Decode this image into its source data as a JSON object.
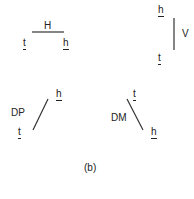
{
  "figure": {
    "caption": "(b)",
    "panels": {
      "horizontal": {
        "label": "H",
        "left_end": "t",
        "right_end": "h"
      },
      "vertical": {
        "label": "V",
        "top_end": "h",
        "bottom_end": "t"
      },
      "diagonal_plus": {
        "label": "DP",
        "top_end": "h",
        "bottom_end": "t"
      },
      "diagonal_minus": {
        "label": "DM",
        "top_end": "t",
        "bottom_end": "h"
      }
    },
    "line_color": "#333333"
  }
}
